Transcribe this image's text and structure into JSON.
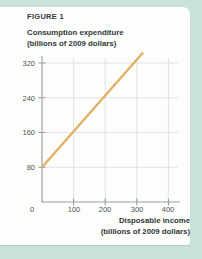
{
  "figure": {
    "label": "FIGURE 1",
    "y_axis_title_line1": "Consumption expenditure",
    "y_axis_title_line2": "(billions of 2009 dollars)",
    "x_axis_title_line1": "Disposable income",
    "x_axis_title_line2": "(billions of 2009 dollars)"
  },
  "chart_data": {
    "type": "line",
    "title": "FIGURE 1",
    "ylabel": "Consumption expenditure (billions of 2009 dollars)",
    "xlabel": "Disposable income (billions of 2009 dollars)",
    "x_ticks": [
      0,
      100,
      200,
      300,
      400
    ],
    "y_ticks": [
      80,
      160,
      240,
      320
    ],
    "xlim": [
      0,
      435
    ],
    "ylim": [
      0,
      335
    ],
    "grid": true,
    "legend_position": "none",
    "series": [
      {
        "name": "consumption-function",
        "color": "#e1b264",
        "points": [
          [
            0,
            80
          ],
          [
            320,
            344
          ]
        ]
      }
    ]
  },
  "colors": {
    "page_background": "#cbe2dc",
    "card_background": "#fdfdfb",
    "line": "#e1b264",
    "gridline": "#c6d0cd",
    "axis": "#99a3a2",
    "tick": "#8e9897",
    "heading_text": "#2e3839",
    "tick_text": "#4c5454"
  }
}
